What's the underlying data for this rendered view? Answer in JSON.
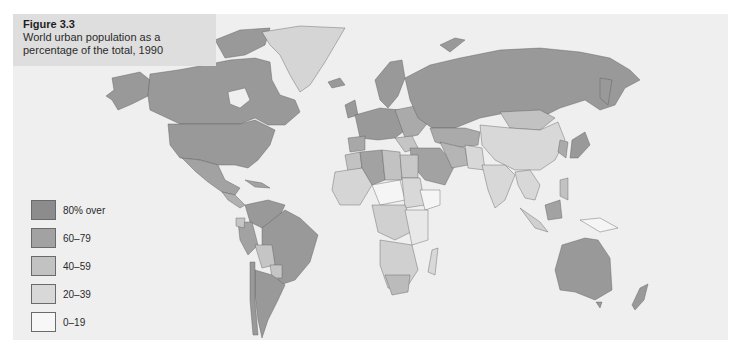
{
  "figure": {
    "label": "Figure 3.3",
    "caption": "World urban population as a percentage of the total, 1990"
  },
  "legend": {
    "items": [
      {
        "label": "80% over",
        "color": "#8c8c8c"
      },
      {
        "label": "60–79",
        "color": "#a2a2a2"
      },
      {
        "label": "40–59",
        "color": "#c2c2c2"
      },
      {
        "label": "20–39",
        "color": "#d8d8d8"
      },
      {
        "label": "0–19",
        "color": "#f7f7f7"
      }
    ]
  },
  "colors": {
    "panel_background": "#efefef",
    "title_background": "#dedede",
    "ocean": "#efefef",
    "border": "#2a2a2a"
  }
}
